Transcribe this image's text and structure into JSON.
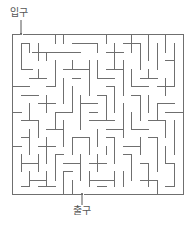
{
  "labels": {
    "entrance": "입구",
    "exit": "출구"
  },
  "colors": {
    "wall": "#6f6f6f",
    "background": "#ffffff",
    "label": "#555555"
  },
  "maze": {
    "frame": {
      "x0": 12,
      "y0": 34,
      "x1": 183,
      "y1": 194
    },
    "cell_size": 8.5,
    "entrance": {
      "x": 21,
      "y": 34
    },
    "exit": {
      "x": 82,
      "y": 194
    },
    "walls": [
      [
        12,
        34,
        19,
        34
      ],
      [
        23,
        34,
        183,
        34
      ],
      [
        12,
        34,
        12,
        194
      ],
      [
        183,
        34,
        183,
        194
      ],
      [
        12,
        194,
        80,
        194
      ],
      [
        84,
        194,
        183,
        194
      ],
      [
        21,
        43,
        21,
        69
      ],
      [
        21,
        43,
        29,
        43
      ],
      [
        21,
        69,
        32,
        69
      ],
      [
        29,
        43,
        29,
        52
      ],
      [
        32,
        52,
        80,
        52
      ],
      [
        38,
        43,
        38,
        60
      ],
      [
        46,
        52,
        46,
        60
      ],
      [
        55,
        34,
        55,
        43
      ],
      [
        63,
        34,
        63,
        43
      ],
      [
        72,
        43,
        97,
        43
      ],
      [
        97,
        43,
        97,
        52
      ],
      [
        106,
        34,
        106,
        43
      ],
      [
        106,
        52,
        123,
        52
      ],
      [
        114,
        43,
        114,
        60
      ],
      [
        123,
        43,
        140,
        43
      ],
      [
        131,
        34,
        131,
        52
      ],
      [
        140,
        43,
        140,
        69
      ],
      [
        148,
        34,
        148,
        60
      ],
      [
        157,
        43,
        157,
        69
      ],
      [
        165,
        34,
        165,
        52
      ],
      [
        174,
        43,
        174,
        86
      ],
      [
        165,
        60,
        174,
        60
      ],
      [
        12,
        86,
        29,
        86
      ],
      [
        29,
        78,
        46,
        78
      ],
      [
        38,
        69,
        38,
        78
      ],
      [
        55,
        60,
        55,
        86
      ],
      [
        46,
        86,
        55,
        86
      ],
      [
        63,
        69,
        89,
        69
      ],
      [
        72,
        60,
        72,
        69
      ],
      [
        89,
        60,
        89,
        95
      ],
      [
        63,
        78,
        63,
        103
      ],
      [
        72,
        78,
        80,
        78
      ],
      [
        97,
        60,
        97,
        78
      ],
      [
        97,
        78,
        114,
        78
      ],
      [
        106,
        69,
        123,
        69
      ],
      [
        114,
        60,
        114,
        69
      ],
      [
        123,
        60,
        123,
        95
      ],
      [
        131,
        69,
        131,
        86
      ],
      [
        131,
        86,
        148,
        86
      ],
      [
        140,
        78,
        157,
        78
      ],
      [
        148,
        69,
        148,
        78
      ],
      [
        157,
        86,
        174,
        86
      ],
      [
        165,
        78,
        165,
        95
      ],
      [
        106,
        86,
        114,
        86
      ],
      [
        114,
        86,
        114,
        112
      ],
      [
        97,
        95,
        106,
        95
      ],
      [
        106,
        95,
        106,
        120
      ],
      [
        21,
        95,
        38,
        95
      ],
      [
        29,
        103,
        29,
        120
      ],
      [
        38,
        103,
        55,
        103
      ],
      [
        46,
        95,
        46,
        112
      ],
      [
        72,
        86,
        72,
        112
      ],
      [
        80,
        95,
        80,
        129
      ],
      [
        80,
        103,
        97,
        103
      ],
      [
        89,
        112,
        97,
        112
      ],
      [
        131,
        95,
        140,
        95
      ],
      [
        140,
        95,
        140,
        120
      ],
      [
        148,
        95,
        148,
        112
      ],
      [
        157,
        103,
        174,
        103
      ],
      [
        157,
        103,
        157,
        120
      ],
      [
        165,
        112,
        183,
        112
      ],
      [
        12,
        112,
        21,
        112
      ],
      [
        21,
        120,
        38,
        120
      ],
      [
        38,
        120,
        38,
        137
      ],
      [
        55,
        112,
        72,
        112
      ],
      [
        55,
        112,
        55,
        129
      ],
      [
        46,
        129,
        63,
        129
      ],
      [
        63,
        120,
        63,
        146
      ],
      [
        89,
        120,
        114,
        120
      ],
      [
        97,
        129,
        97,
        146
      ],
      [
        106,
        129,
        123,
        129
      ],
      [
        123,
        103,
        123,
        137
      ],
      [
        131,
        112,
        131,
        129
      ],
      [
        131,
        129,
        148,
        129
      ],
      [
        148,
        120,
        165,
        120
      ],
      [
        165,
        120,
        165,
        137
      ],
      [
        174,
        120,
        174,
        154
      ],
      [
        21,
        137,
        29,
        137
      ],
      [
        29,
        129,
        29,
        154
      ],
      [
        12,
        146,
        21,
        146
      ],
      [
        38,
        146,
        55,
        146
      ],
      [
        46,
        137,
        46,
        163
      ],
      [
        72,
        137,
        89,
        137
      ],
      [
        72,
        137,
        72,
        154
      ],
      [
        89,
        137,
        89,
        154
      ],
      [
        106,
        137,
        114,
        137
      ],
      [
        114,
        137,
        114,
        163
      ],
      [
        123,
        146,
        140,
        146
      ],
      [
        140,
        137,
        140,
        154
      ],
      [
        148,
        137,
        157,
        137
      ],
      [
        157,
        137,
        157,
        171
      ],
      [
        21,
        163,
        38,
        163
      ],
      [
        21,
        154,
        21,
        171
      ],
      [
        38,
        154,
        38,
        171
      ],
      [
        55,
        154,
        63,
        154
      ],
      [
        55,
        154,
        55,
        180
      ],
      [
        63,
        163,
        80,
        163
      ],
      [
        80,
        154,
        80,
        180
      ],
      [
        89,
        163,
        106,
        163
      ],
      [
        97,
        154,
        97,
        171
      ],
      [
        106,
        146,
        106,
        154
      ],
      [
        123,
        154,
        131,
        154
      ],
      [
        131,
        154,
        131,
        180
      ],
      [
        140,
        163,
        148,
        163
      ],
      [
        148,
        163,
        148,
        186
      ],
      [
        165,
        146,
        165,
        163
      ],
      [
        165,
        163,
        174,
        163
      ],
      [
        174,
        163,
        174,
        186
      ],
      [
        29,
        180,
        46,
        180
      ],
      [
        29,
        171,
        29,
        186
      ],
      [
        46,
        171,
        46,
        186
      ],
      [
        63,
        171,
        72,
        171
      ],
      [
        63,
        171,
        63,
        194
      ],
      [
        89,
        180,
        114,
        180
      ],
      [
        89,
        171,
        89,
        186
      ],
      [
        114,
        171,
        114,
        186
      ],
      [
        123,
        171,
        123,
        186
      ],
      [
        97,
        186,
        106,
        186
      ],
      [
        140,
        180,
        157,
        180
      ],
      [
        157,
        180,
        157,
        194
      ],
      [
        165,
        186,
        174,
        186
      ],
      [
        21,
        186,
        29,
        186
      ],
      [
        38,
        186,
        55,
        186
      ],
      [
        72,
        180,
        72,
        194
      ]
    ]
  }
}
